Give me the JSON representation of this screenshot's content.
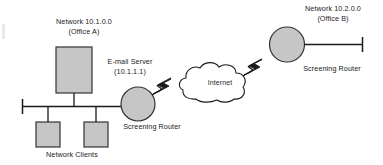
{
  "diagram": {
    "colors": {
      "node_fill": "#c6c6c6",
      "node_stroke": "#333333",
      "line": "#1a1a1a",
      "text": "#1a1a1a",
      "background": "#ffffff"
    },
    "networks": [
      {
        "id": "office-a",
        "network_label": "Network 10.1.0.0",
        "office_label": "(Office A)"
      },
      {
        "id": "office-b",
        "network_label": "Network 10.2.0.0",
        "office_label": "(Office B)"
      }
    ],
    "nodes": [
      {
        "id": "email-server",
        "shape": "rectangle",
        "label": "E-mail Server",
        "address": "(10.1.1.1)"
      },
      {
        "id": "screening-router-left",
        "shape": "circle",
        "label": "Screening Router"
      },
      {
        "id": "screening-router-right",
        "shape": "circle",
        "label": "Screening Router"
      },
      {
        "id": "internet-cloud",
        "shape": "cloud",
        "label": "Internet"
      },
      {
        "id": "network-client-1",
        "shape": "rectangle",
        "label": ""
      },
      {
        "id": "network-client-2",
        "shape": "rectangle",
        "label": ""
      }
    ],
    "group_labels": [
      {
        "id": "network-clients",
        "label": "Network Clients"
      }
    ],
    "links": [
      {
        "from": "screening-router-left",
        "to": "internet-cloud",
        "style": "lightning"
      },
      {
        "from": "internet-cloud",
        "to": "screening-router-right",
        "style": "lightning"
      },
      {
        "from": "email-server",
        "to": "bus-office-a",
        "style": "solid"
      },
      {
        "from": "network-client-1",
        "to": "bus-office-a",
        "style": "solid"
      },
      {
        "from": "network-client-2",
        "to": "bus-office-a",
        "style": "solid"
      },
      {
        "from": "bus-office-a",
        "to": "screening-router-left",
        "style": "solid"
      },
      {
        "from": "screening-router-right",
        "to": "bus-office-b",
        "style": "solid"
      }
    ]
  }
}
